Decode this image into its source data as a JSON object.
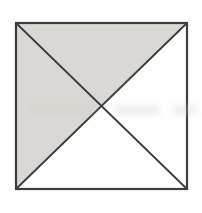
{
  "figure": {
    "canvas": {
      "width": 202,
      "height": 213,
      "background": "#ffffff"
    },
    "square": {
      "x1": 16,
      "y1": 23,
      "x2": 187,
      "y2": 189
    },
    "center": {
      "x": 101.5,
      "y": 106
    },
    "colors": {
      "shaded_fill": "#d9d8d4",
      "unshaded_fill": "#fefefe",
      "stroke": "#3d3d3d",
      "artifact": "#cfcdc6"
    },
    "stroke_width": {
      "outline": 2.2,
      "diagonal": 1.8
    },
    "triangles": [
      {
        "name": "top-triangle",
        "shaded": true
      },
      {
        "name": "right-triangle",
        "shaded": false
      },
      {
        "name": "bottom-triangle",
        "shaded": false
      },
      {
        "name": "left-triangle",
        "shaded": true
      }
    ],
    "diagonals": [
      {
        "name": "diagonal-topleft-bottomright",
        "from": "tl",
        "to": "br"
      },
      {
        "name": "diagonal-topright-bottomleft",
        "from": "tr",
        "to": "bl"
      }
    ],
    "artifacts": [
      {
        "left": 28,
        "top": 104,
        "width": 66,
        "height": 11
      },
      {
        "left": 114,
        "top": 105,
        "width": 46,
        "height": 10
      },
      {
        "left": 172,
        "top": 105,
        "width": 26,
        "height": 10
      }
    ]
  }
}
